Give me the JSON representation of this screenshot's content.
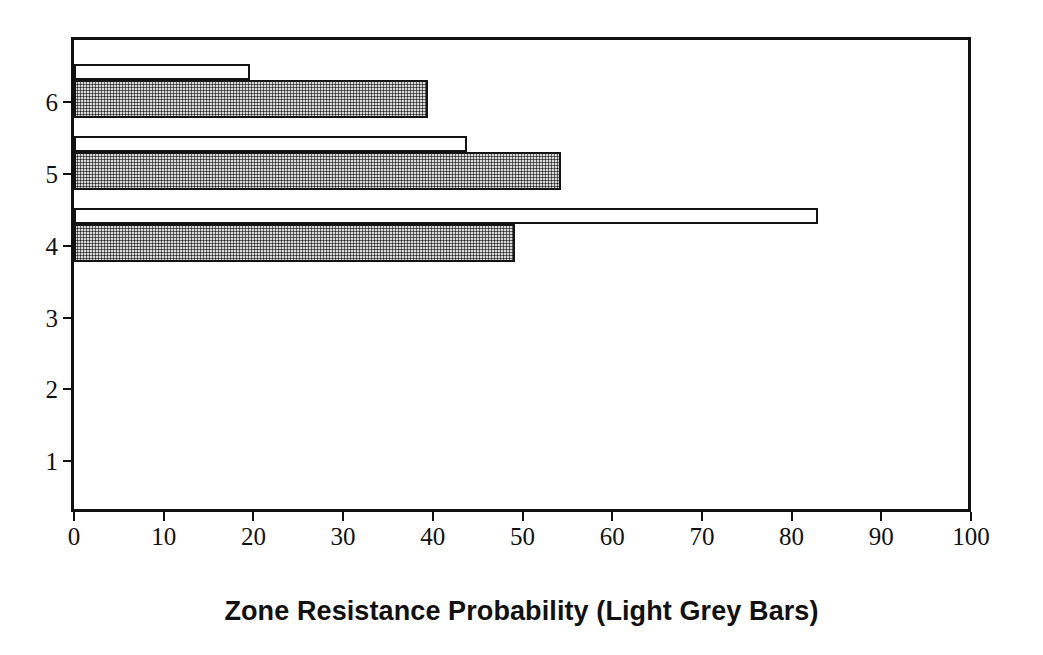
{
  "chart_data": {
    "type": "bar",
    "orientation": "horizontal",
    "title": "",
    "xlabel": "Zone Resistance Probability (Light Grey Bars)",
    "ylabel": "",
    "xlim": [
      0,
      100
    ],
    "ylim": [
      0.5,
      6.5
    ],
    "grid": false,
    "legend": null,
    "xticks": [
      "0",
      "10",
      "20",
      "30",
      "40",
      "50",
      "60",
      "70",
      "80",
      "90",
      "100"
    ],
    "xtick_values": [
      0,
      10,
      20,
      30,
      40,
      50,
      60,
      70,
      80,
      90,
      100
    ],
    "yticks": [
      "1",
      "2",
      "3",
      "4",
      "5",
      "6"
    ],
    "ytick_values": [
      1,
      2,
      3,
      4,
      5,
      6
    ],
    "categories": [
      "1",
      "2",
      "3",
      "4",
      "5",
      "6"
    ],
    "series": [
      {
        "name": "White Bars",
        "style": "open-outline",
        "values": [
          0,
          0,
          0,
          82.9,
          43.8,
          19.6
        ]
      },
      {
        "name": "Light Grey Bars",
        "style": "grey-stipple",
        "values": [
          0,
          0,
          0,
          49.2,
          54.3,
          39.5
        ]
      }
    ]
  },
  "axis": {
    "x_title": "Zone Resistance Probability (Light Grey Bars)"
  },
  "colors": {
    "frame": "#111111",
    "bar_outline": "#141414",
    "bar_open_fill": "#ffffff",
    "bar_grey_fill": "#d9d9d9",
    "background": "#ffffff",
    "text": "#111111"
  },
  "geometry": {
    "plot_left_px": 71,
    "plot_top_px": 37,
    "plot_width_px": 900,
    "plot_height_px": 475,
    "x_zero_px": 74,
    "x_unit_px": 8.97,
    "row_centers_px": [
      461,
      389,
      318,
      246,
      174,
      102
    ],
    "bar_open_height_px": 16,
    "bar_grey_height_px": 38
  }
}
